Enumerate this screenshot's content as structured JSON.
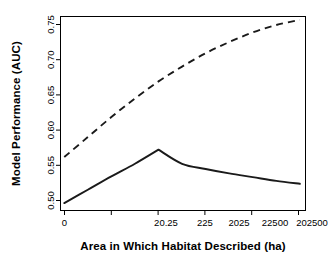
{
  "chart_data": {
    "type": "line",
    "title": "",
    "xlabel": "Area in Which Habitat Described (ha)",
    "ylabel": "Model Performance (AUC)",
    "x_tick_labels": [
      "0",
      "20.25",
      "225",
      "2025",
      "22500",
      "202500"
    ],
    "x_tick_positions": [
      0,
      1,
      2,
      3,
      4,
      5
    ],
    "xlim": [
      -0.08,
      5.12
    ],
    "y_tick_labels": [
      "0.50",
      "0.55",
      "0.60",
      "0.65",
      "0.70",
      "0.75"
    ],
    "y_tick_values": [
      0.5,
      0.55,
      0.6,
      0.65,
      0.7,
      0.75
    ],
    "ylim": [
      0.495,
      0.7565
    ],
    "grid": false,
    "legend": "none",
    "series": [
      {
        "name": "solid-curve",
        "style": "solid",
        "color": "#1a1a1a",
        "x": [
          0,
          0.5,
          1,
          1.5,
          2,
          2.5,
          3,
          3.5,
          4,
          4.5,
          5
        ],
        "values": [
          0.505,
          0.523,
          0.541,
          0.558,
          0.577,
          0.558,
          0.551,
          0.545,
          0.54,
          0.535,
          0.531
        ]
      },
      {
        "name": "dashed-curve",
        "style": "dashed",
        "color": "#1a1a1a",
        "x": [
          0,
          0.5,
          1,
          1.5,
          2,
          2.5,
          3,
          3.5,
          4,
          4.5,
          5
        ],
        "values": [
          0.567,
          0.594,
          0.621,
          0.646,
          0.669,
          0.689,
          0.707,
          0.722,
          0.735,
          0.745,
          0.752
        ]
      }
    ],
    "annotations": []
  },
  "axes": {
    "y_title": "Model Performance (AUC)",
    "x_title": "Area in Which Habitat Described (ha)"
  },
  "y_ticks": [
    {
      "label": "0.50"
    },
    {
      "label": "0.55"
    },
    {
      "label": "0.60"
    },
    {
      "label": "0.65"
    },
    {
      "label": "0.70"
    },
    {
      "label": "0.75"
    }
  ],
  "x_ticks": [
    {
      "label": "0"
    },
    {
      "label": "20.25"
    },
    {
      "label": "225"
    },
    {
      "label": "2025"
    },
    {
      "label": "22500"
    },
    {
      "label": "202500"
    }
  ]
}
